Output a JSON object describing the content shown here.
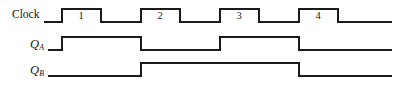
{
  "figure": {
    "type": "timing-diagram",
    "title": "",
    "background_color": "#ffffff",
    "line_color": "#1a1a1a",
    "line_width": 1.5,
    "width": 400,
    "height": 93
  },
  "signals": [
    {
      "name": "clock",
      "label": "Clock",
      "label_sub": "",
      "baseline_y": 22,
      "high_y": 9,
      "start_x": 44,
      "end_x": 392,
      "transitions_x": [
        62,
        101,
        141,
        180,
        220,
        259,
        299,
        338
      ],
      "initial_level": "low",
      "pulse_labels": [
        "1",
        "2",
        "3",
        "4"
      ],
      "pulse_label_x": [
        81,
        160,
        239,
        318
      ],
      "pulse_label_y": 11
    },
    {
      "name": "q-a",
      "label": "Q",
      "label_sub": "A",
      "baseline_y": 50,
      "high_y": 37,
      "start_x": 48,
      "end_x": 392,
      "transitions_x": [
        62,
        141,
        220,
        299
      ],
      "initial_level": "low",
      "pulse_labels": [],
      "pulse_label_x": [],
      "pulse_label_y": 0
    },
    {
      "name": "q-b",
      "label": "Q",
      "label_sub": "B",
      "baseline_y": 76,
      "high_y": 63,
      "start_x": 48,
      "end_x": 392,
      "transitions_x": [
        141,
        299
      ],
      "initial_level": "low",
      "pulse_labels": [],
      "pulse_label_x": [],
      "pulse_label_y": 0
    }
  ],
  "chart_data": {
    "type": "line",
    "title": "",
    "xlabel": "",
    "ylabel": "",
    "series": [
      {
        "name": "Clock",
        "values": [
          0,
          1,
          0,
          1,
          0,
          1,
          0,
          1,
          0
        ],
        "edge_x": [
          44,
          62,
          101,
          141,
          180,
          220,
          259,
          299,
          338
        ]
      },
      {
        "name": "QA",
        "values": [
          0,
          1,
          0,
          1,
          0
        ],
        "edge_x": [
          48,
          62,
          141,
          220,
          299
        ]
      },
      {
        "name": "QB",
        "values": [
          0,
          1,
          0
        ],
        "edge_x": [
          48,
          141,
          299
        ]
      }
    ]
  }
}
